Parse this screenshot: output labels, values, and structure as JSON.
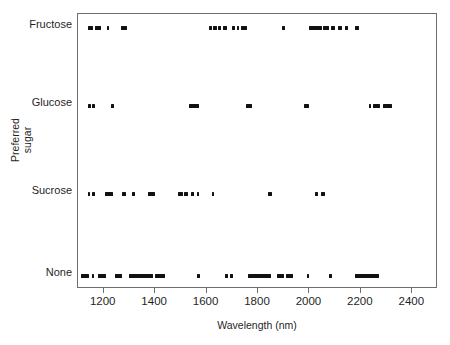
{
  "chart_data": {
    "type": "scatter",
    "title": "",
    "subtitle": "",
    "xlabel": "Wavelength (nm)",
    "ylabel": "Preferred sugar",
    "ylabel_lines": [
      "Preferred",
      "sugar"
    ],
    "xlim": [
      1100,
      2500
    ],
    "xticks": [
      1200,
      1400,
      1600,
      1800,
      2000,
      2200,
      2400
    ],
    "xticklabels": [
      "1200",
      "1400",
      "1600",
      "1800",
      "2000",
      "2200",
      "2400"
    ],
    "categories": [
      "Fructose",
      "Glucose",
      "Sucrose",
      "None"
    ],
    "grid": false,
    "legend": "none",
    "marker": "horizontal-dash",
    "marker_color": "#111111",
    "frame_color": "#6e6e6e",
    "background": "#ffffff",
    "series": [
      {
        "name": "Fructose",
        "row": 0,
        "intervals": [
          [
            1137,
            1160
          ],
          [
            1166,
            1189
          ],
          [
            1212,
            1222
          ],
          [
            1268,
            1292
          ],
          [
            1610,
            1622
          ],
          [
            1626,
            1640
          ],
          [
            1645,
            1651
          ],
          [
            1663,
            1680
          ],
          [
            1698,
            1710
          ],
          [
            1717,
            1722
          ],
          [
            1735,
            1758
          ],
          [
            1892,
            1906
          ],
          [
            2000,
            2048
          ],
          [
            2051,
            2078
          ],
          [
            2082,
            2100
          ],
          [
            2112,
            2128
          ],
          [
            2140,
            2148
          ],
          [
            2178,
            2194
          ]
        ]
      },
      {
        "name": "Glucose",
        "row": 1,
        "intervals": [
          [
            1140,
            1146
          ],
          [
            1156,
            1162
          ],
          [
            1228,
            1234
          ],
          [
            1530,
            1570
          ],
          [
            1752,
            1778
          ],
          [
            1978,
            1998
          ],
          [
            2230,
            2238
          ],
          [
            2248,
            2274
          ],
          [
            2288,
            2320
          ]
        ]
      },
      {
        "name": "Sucrose",
        "row": 2,
        "intervals": [
          [
            1138,
            1146
          ],
          [
            1156,
            1164
          ],
          [
            1204,
            1236
          ],
          [
            1272,
            1288
          ],
          [
            1310,
            1316
          ],
          [
            1372,
            1400
          ],
          [
            1490,
            1508
          ],
          [
            1514,
            1528
          ],
          [
            1538,
            1552
          ],
          [
            1562,
            1568
          ],
          [
            1620,
            1628
          ],
          [
            1840,
            1856
          ],
          [
            2020,
            2032
          ],
          [
            2046,
            2062
          ]
        ]
      },
      {
        "name": "None",
        "row": 3,
        "intervals": [
          [
            1110,
            1142
          ],
          [
            1154,
            1160
          ],
          [
            1176,
            1210
          ],
          [
            1242,
            1272
          ],
          [
            1300,
            1392
          ],
          [
            1398,
            1440
          ],
          [
            1564,
            1570
          ],
          [
            1670,
            1682
          ],
          [
            1692,
            1704
          ],
          [
            1760,
            1850
          ],
          [
            1874,
            1900
          ],
          [
            1908,
            1936
          ],
          [
            1990,
            1998
          ],
          [
            2076,
            2082
          ],
          [
            2178,
            2270
          ]
        ]
      }
    ]
  }
}
